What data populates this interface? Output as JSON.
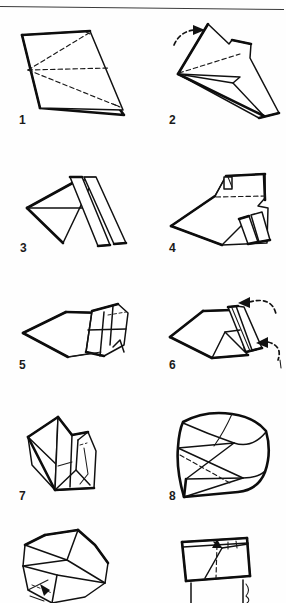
{
  "document": {
    "type": "origami-instruction-diagram",
    "title": "",
    "page_rule": true,
    "background_color": "#ffffff",
    "ink_color": "#111111"
  },
  "steps": [
    {
      "number": "1",
      "label": "1",
      "position": "row-1-left",
      "description": "Flat parallelogram sheet with three dashed crease lines radiating from a point on the left edge",
      "has_arrow": false,
      "arrow_count": 0,
      "dashed_lines": 3
    },
    {
      "number": "2",
      "label": "2",
      "position": "row-1-right",
      "description": "Partly folded arrow-like shape with one dashed crease and a curved motion arrow at upper left",
      "has_arrow": true,
      "arrow_count": 1,
      "dashed_lines": 1
    },
    {
      "number": "3",
      "label": "3",
      "position": "row-2-left",
      "description": "Dart shape with two parallel pleated bands folded to the right",
      "has_arrow": false,
      "arrow_count": 0,
      "dashed_lines": 0
    },
    {
      "number": "4",
      "label": "4",
      "position": "row-2-right",
      "description": "Wider flap form with horizontal dashed crease and small pleats top and bottom right",
      "has_arrow": false,
      "arrow_count": 0,
      "dashed_lines": 1
    },
    {
      "number": "5",
      "label": "5",
      "position": "row-3-left",
      "description": "Low angled form with gridded pleat panel on the right and a short dashed crease",
      "has_arrow": false,
      "arrow_count": 0,
      "dashed_lines": 1
    },
    {
      "number": "6",
      "label": "6",
      "position": "row-3-right",
      "description": "Same low form with a raised pleat ridge and two curved arrows pointing in from the right",
      "has_arrow": true,
      "arrow_count": 2,
      "dashed_lines": 0
    },
    {
      "number": "7",
      "label": "7",
      "position": "row-4-left",
      "description": "Upright three dimensional form seen from the side with internal fold lines",
      "has_arrow": false,
      "arrow_count": 0,
      "dashed_lines": 1
    },
    {
      "number": "8",
      "label": "8",
      "position": "row-4-right",
      "description": "Rounded cup-like three dimensional form with a hidden dashed edge at lower left",
      "has_arrow": false,
      "arrow_count": 0,
      "dashed_lines": 1
    },
    {
      "number": "9",
      "label": "",
      "position": "row-5-left",
      "description": "Open bowl form viewed from above, partially cropped at the page bottom",
      "has_arrow": true,
      "arrow_count": 1,
      "dashed_lines": 1
    },
    {
      "number": "10",
      "label": "",
      "position": "row-5-right",
      "description": "Box form viewed from the front with vertical dashed centre line, cropped at the page bottom",
      "has_arrow": false,
      "arrow_count": 0,
      "dashed_lines": 1
    }
  ],
  "page_marks": {
    "top_rule": "horizontal rule across top of page",
    "right_edge_tick": "small tick mark at right edge beside step 6"
  }
}
